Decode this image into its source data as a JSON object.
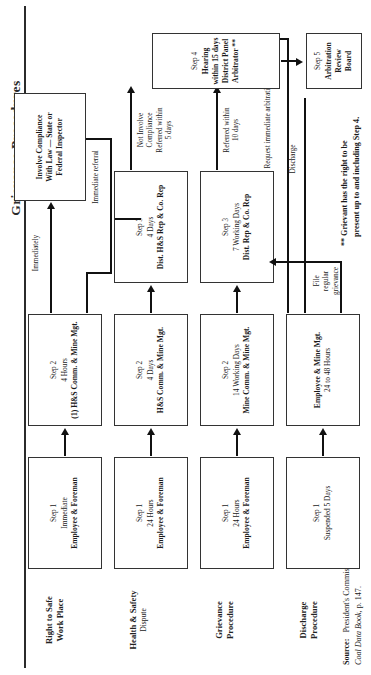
{
  "document": {
    "title": "Grievance Procedures",
    "footnote": {
      "marker": "**",
      "line1": "Grievant has the right to be",
      "line2": "present up to and including Step 4."
    },
    "source": {
      "label": "Source:",
      "line1": "President's Commission on Coal,",
      "line2_italic": "Coal Data Book",
      "line2_rest": ", p. 147."
    }
  },
  "lanes": [
    {
      "id": "right-to-safe-work-place",
      "title": "Right to Safe\nWork Place",
      "line1": "Right to Safe",
      "line2": "Work Place",
      "sub": ""
    },
    {
      "id": "health-and-safety-dispute",
      "line1": "Health & Safety",
      "line2": "",
      "sub": "Dispute"
    },
    {
      "id": "grievance-procedure",
      "line1": "Grievance",
      "line2": "Procedure",
      "sub": ""
    },
    {
      "id": "discharge-procedure",
      "line1": "Discharge",
      "line2": "Procedure",
      "sub": ""
    }
  ],
  "boxes": {
    "safe_step1": {
      "l1": "Step 1",
      "l2": "Immediate",
      "l3": "Employee & Foreman",
      "l4": ""
    },
    "safe_step2": {
      "l1": "Step 2",
      "l2": "4 Hours",
      "l3": "(1) H&S Comm. & Mine Mgt.",
      "l4": ""
    },
    "hs_step1": {
      "l1": "Step 1",
      "l2": "24 Hours",
      "l3": "Employee & Foreman",
      "l4": ""
    },
    "hs_step2": {
      "l1": "Step 2",
      "l2": "4 Days",
      "l3": "H&S Comm. & Mine Mgt.",
      "l4": ""
    },
    "hs_step3": {
      "l1": "Step 3",
      "l2": "4 Days",
      "l3": "Dist. H&S Rep & Co. Rep",
      "l4": ""
    },
    "gr_step1": {
      "l1": "Step 1",
      "l2": "24 Hours",
      "l3": "Employee & Foreman",
      "l4": ""
    },
    "gr_step2": {
      "l1": "Step 2",
      "l2": "14 Working Days",
      "l3": "Mine Comm. & Mine Mgt.",
      "l4": ""
    },
    "gr_step3": {
      "l1": "Step 3",
      "l2": "7 Working Days",
      "l3": "Dist. Rep & Co. Rep",
      "l4": ""
    },
    "dis_step1": {
      "l1": "Step 1",
      "l2": "Suspended 5 Days",
      "l3": "",
      "l4": ""
    },
    "dis_step2": {
      "l1": "Employee & Mine Mgt.",
      "l2": "24 to 48 Hours",
      "l3": "",
      "l4": ""
    },
    "compliance": {
      "l1": "Involve Compliance",
      "l2": "With Law — State or",
      "l3": "Federal Inspector",
      "l4": ""
    },
    "step4": {
      "l1": "Step 4",
      "l2": "Hearing within 15 days",
      "l3": "District Panel",
      "l4": "Arbitrator **"
    },
    "step5": {
      "l1": "Step 5",
      "l2": "Arbitration Review",
      "l3": "Board",
      "l4": ""
    }
  },
  "edge_labels": {
    "immediately": "Immediately",
    "immediate_referral_bottom": "Immediate referral",
    "not_involve_compliance": "Not  Involve\nCompliance\nReferred within\n5 days",
    "nic_l1": "Not  Involve",
    "nic_l2": "Compliance",
    "nic_l3": "Referred within",
    "nic_l4": "5 days",
    "referred_within_10_l1": "Referred within",
    "referred_within_10_l2": "10 days",
    "file_regular_grievance_l1": "File",
    "file_regular_grievance_l2": "regular",
    "file_regular_grievance_l3": "grievance",
    "discharge": "Discharge",
    "request_immediate_arbitration_l1": "Request",
    "request_immediate_arbitration_l2": "immediate",
    "request_immediate_arbitration_l3": "arbitration",
    "immediate_referral_top": "Immediate referral"
  },
  "colors": {
    "ink": "#1a1a1a",
    "rule": "#2b2b2b",
    "box_border": "#333333",
    "paper": "#ffffff"
  }
}
